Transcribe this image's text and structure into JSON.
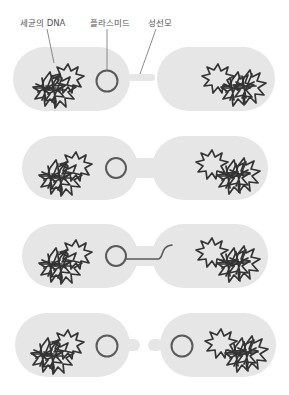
{
  "figure": {
    "labels": {
      "bacterial_dna": "세균의 DNA",
      "plasmid": "플라스미드",
      "sex_pilus": "성선모"
    },
    "stages": [
      {
        "step": 1,
        "description": "Donor cell extends sex pilus toward recipient cell"
      },
      {
        "step": 2,
        "description": "Cells joined by a cytoplasmic bridge"
      },
      {
        "step": 3,
        "description": "Plasmid strand transferred into recipient"
      },
      {
        "step": 4,
        "description": "Cells separate, each containing a plasmid"
      }
    ],
    "colors": {
      "cell_fill": "#e6e6e6",
      "dna_stroke": "#333333",
      "plasmid_stroke": "#5a5a5a",
      "label_text": "#555555",
      "background": "#ffffff"
    }
  }
}
